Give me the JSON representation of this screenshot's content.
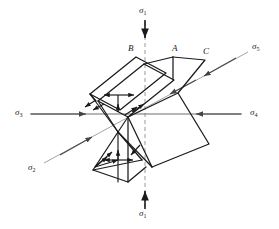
{
  "figure": {
    "width": 279,
    "height": 229,
    "background": "#ffffff",
    "line_color": "#1a1a1a",
    "axis_color": "#555555",
    "dashed_axis_color": "#8a8a8a",
    "diagonal_axis_color": "#8a8a8a"
  },
  "axis_labels": {
    "top": {
      "text": "σ",
      "sub": "1",
      "full": "σ1"
    },
    "bottom": {
      "text": "σ",
      "sub": "1",
      "full": "σ1"
    },
    "left": {
      "text": "σ",
      "sub": "3",
      "full": "σ3"
    },
    "right": {
      "text": "σ",
      "sub": "4",
      "full": "σ4"
    },
    "upper_right_diagonal": {
      "text": "σ",
      "sub": "5",
      "full": "σ5"
    },
    "lower_left_diagonal": {
      "text": "σ",
      "sub": "2",
      "full": "σ2"
    }
  },
  "point_labels": [
    {
      "id": "B",
      "text": "B"
    },
    {
      "id": "A",
      "text": "A"
    },
    {
      "id": "C",
      "text": "C"
    }
  ],
  "geometry": {
    "origin": {
      "x": 118,
      "y": 132
    },
    "vertical_axis_x": 145,
    "horizontal_axis_y": 114,
    "upper_plane_vertices": "folded quadrilateral plane through B and A",
    "right_plane_vertices": "folded zigzag plane through C",
    "lower_plane_vertices": "folded zigzag plane below origin"
  },
  "arrows": {
    "count_center_cluster": 10,
    "description": "small traction arrows radiating outward at the centre of the folded planes"
  }
}
